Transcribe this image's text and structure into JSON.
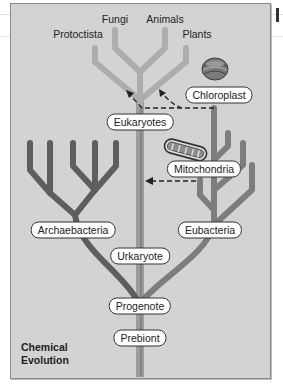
{
  "diagram": {
    "type": "phylogenetic-tree",
    "top_labels": {
      "fungi": "Fungi",
      "animals": "Animals",
      "protoctista": "Protoctista",
      "plants": "Plants"
    },
    "nodes": {
      "chloroplast": "Chloroplast",
      "eukaryotes": "Eukaryotes",
      "mitochondria": "Mitochondria",
      "archaebacteria": "Archaebacteria",
      "eubacteria": "Eubacteria",
      "urkaryote": "Urkaryote",
      "progenote": "Progenote",
      "prebiont": "Prebiont"
    },
    "corner_label": {
      "line1": "Chemical",
      "line2": "Evolution"
    },
    "icons": [
      "chloroplast-icon",
      "mitochondrion-icon"
    ],
    "colors": {
      "background": "#d3d3d3",
      "eukaryote_branch": "#a9a9a9",
      "archaebacteria_branch": "#5e5e5e",
      "eubacteria_branch": "#7d7d7d",
      "central_trunk": "#9c9c9c",
      "pill_fill": "#ffffff",
      "pill_border": "#333333"
    }
  }
}
